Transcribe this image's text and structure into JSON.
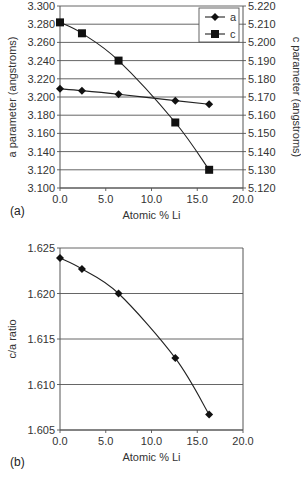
{
  "chart_data": [
    {
      "panel": "(a)",
      "type": "line",
      "xlabel": "Atomic % Li",
      "ylabel": "a parameter (angstroms)",
      "y2label": "c parameter (angstroms)",
      "xlim": [
        0,
        20
      ],
      "ylim": [
        3.1,
        3.3
      ],
      "y2lim": [
        5.12,
        5.22
      ],
      "x_ticks": [
        "0.0",
        "5.0",
        "10.0",
        "15.0",
        "20.0"
      ],
      "y_ticks": [
        "3.100",
        "3.120",
        "3.140",
        "3.160",
        "3.180",
        "3.200",
        "3.220",
        "3.240",
        "3.260",
        "3.280",
        "3.300"
      ],
      "y2_ticks": [
        "5.120",
        "5.130",
        "5.140",
        "5.150",
        "5.160",
        "5.170",
        "5.180",
        "5.190",
        "5.200",
        "5.210",
        "5.220"
      ],
      "grid": true,
      "legend_position": "top-right",
      "x": [
        0.0,
        2.4,
        6.4,
        12.6,
        16.3
      ],
      "series": [
        {
          "name": "a",
          "axis": "left",
          "marker": "diamond",
          "values": [
            3.209,
            3.207,
            3.203,
            3.196,
            3.192
          ]
        },
        {
          "name": "c",
          "axis": "right",
          "marker": "square",
          "values": [
            5.211,
            5.205,
            5.19,
            5.156,
            5.13
          ]
        }
      ]
    },
    {
      "panel": "(b)",
      "type": "line",
      "xlabel": "Atomic % Li",
      "ylabel": "c/a ratio",
      "xlim": [
        0,
        20
      ],
      "ylim": [
        1.605,
        1.625
      ],
      "x_ticks": [
        "0.0",
        "5.0",
        "10.0",
        "15.0",
        "20.0"
      ],
      "y_ticks": [
        "1.605",
        "1.610",
        "1.615",
        "1.620",
        "1.625"
      ],
      "grid": true,
      "x": [
        0.0,
        2.4,
        6.4,
        12.6,
        16.3
      ],
      "series": [
        {
          "name": "c/a",
          "marker": "diamond",
          "values": [
            1.6239,
            1.6227,
            1.62,
            1.6129,
            1.6067
          ]
        }
      ]
    }
  ],
  "labels": {
    "panel_a": "(a)",
    "panel_b": "(b)",
    "legend_a": "a",
    "legend_c": "c"
  }
}
